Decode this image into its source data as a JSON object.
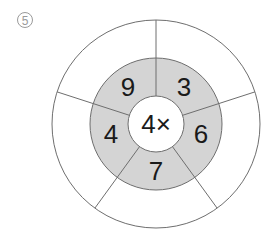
{
  "problem_label": "5",
  "diagram": {
    "center_text": "4×",
    "sectors": [
      {
        "position": "upper-right",
        "value": "3"
      },
      {
        "position": "right",
        "value": "6"
      },
      {
        "position": "bottom",
        "value": "7"
      },
      {
        "position": "left",
        "value": "4"
      },
      {
        "position": "upper-left",
        "value": "9"
      }
    ],
    "colors": {
      "ring_fill": "#d4d4d4",
      "line": "#6e6e6e",
      "text": "#1a1a1a"
    }
  }
}
